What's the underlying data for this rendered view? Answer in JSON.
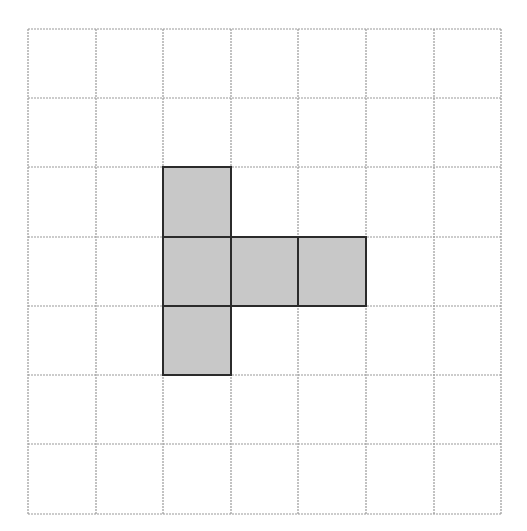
{
  "diagram": {
    "grid": {
      "columns": 7,
      "rows": 7,
      "x_lines": [
        28,
        96,
        163,
        231,
        298,
        366,
        434,
        501
      ],
      "y_lines": [
        29,
        98,
        167,
        237,
        306,
        375,
        444,
        514
      ],
      "line_color": "#9a9a9a",
      "line_dash": "2,1"
    },
    "shaded_cells": [
      {
        "col": 2,
        "row": 2
      },
      {
        "col": 2,
        "row": 3
      },
      {
        "col": 3,
        "row": 3
      },
      {
        "col": 4,
        "row": 3
      },
      {
        "col": 2,
        "row": 4
      }
    ],
    "fill_color": "#c8c8c8",
    "outline_color": "#2b2b2b",
    "background_color": "#ffffff"
  }
}
